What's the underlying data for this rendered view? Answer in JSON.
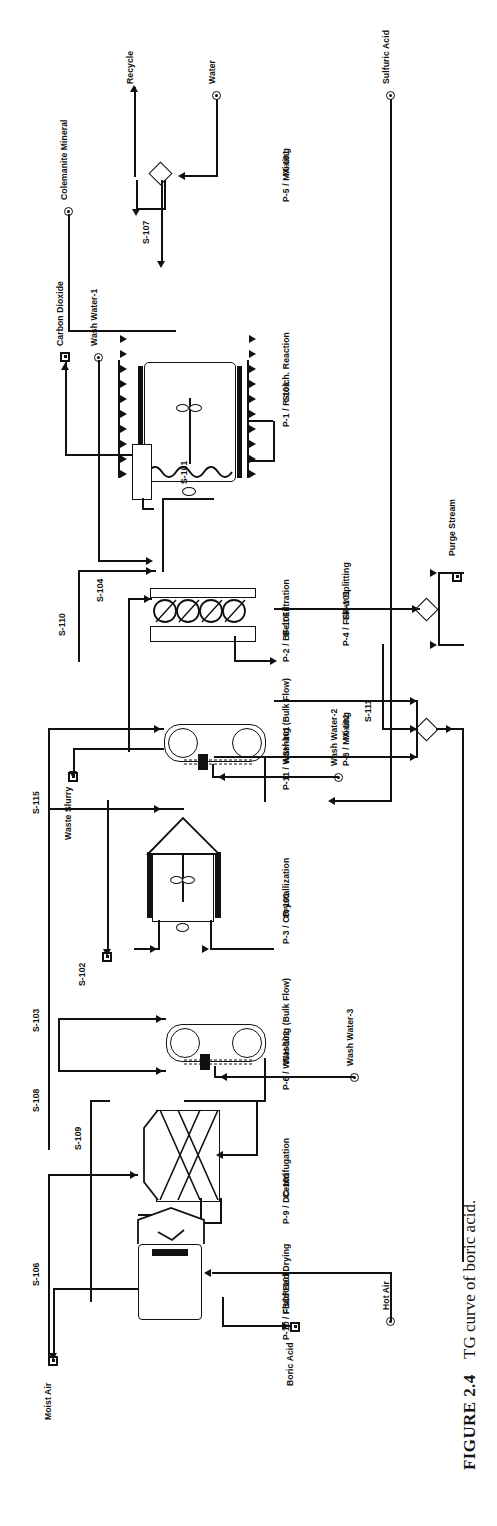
{
  "figure": {
    "number": "FIGURE 2.4",
    "caption": "TG curve of boric acid."
  },
  "diagram": {
    "kind": "process-flow-diagram",
    "unit_operations": [
      {
        "id": "P-1 / R-101",
        "name": "Stoich. Reaction"
      },
      {
        "id": "P-2 / BF-101",
        "name": "Belt Filtration"
      },
      {
        "id": "P-3 / CR-101",
        "name": "Crystallization"
      },
      {
        "id": "P-4 / FSP-101",
        "name": "Flow Splitting"
      },
      {
        "id": "P-5 / MX-101",
        "name": "Mixing"
      },
      {
        "id": "P-6 / WSH-102",
        "name": "Washing (Bulk Flow)"
      },
      {
        "id": "P-8 / MX-102",
        "name": "Mixing"
      },
      {
        "id": "P-9 / DC-101",
        "name": "Centrifugation"
      },
      {
        "id": "P-10 / FBDR-101",
        "name": "Fluid Bed Drying"
      },
      {
        "id": "P-11 / WSH-101",
        "name": "Washing (Bulk Flow)"
      }
    ],
    "input_streams": [
      {
        "label": "Water"
      },
      {
        "label": "Sulfuric Acid"
      },
      {
        "label": "Colemanite Mineral"
      },
      {
        "label": "Wash Water-1"
      },
      {
        "label": "Wash Water-2"
      },
      {
        "label": "Wash Water-3"
      },
      {
        "label": "Hot Air"
      }
    ],
    "output_streams": [
      {
        "label": "Recycle"
      },
      {
        "label": "Carbon Dioxide"
      },
      {
        "label": "Waste Slurry"
      },
      {
        "label": "Purge Stream"
      },
      {
        "label": "Moist Air"
      },
      {
        "label": "Boric Acid"
      }
    ],
    "internal_streams": [
      {
        "label": "S-101"
      },
      {
        "label": "S-102"
      },
      {
        "label": "S-103"
      },
      {
        "label": "S-104"
      },
      {
        "label": "S-105"
      },
      {
        "label": "S-106"
      },
      {
        "label": "S-107"
      },
      {
        "label": "S-108"
      },
      {
        "label": "S-109"
      },
      {
        "label": "S-110"
      },
      {
        "label": "S-111"
      },
      {
        "label": "S-115"
      }
    ]
  }
}
